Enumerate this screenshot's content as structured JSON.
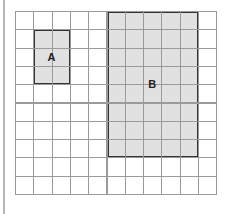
{
  "diagram": {
    "type": "grid-with-rectangles",
    "grid": {
      "columns": 11,
      "rows": 10,
      "cell_size_px": 18.3,
      "origin_px": [
        15,
        11
      ],
      "line_color": "#9a9a9a"
    },
    "shapes": [
      {
        "label": "A",
        "col": 1,
        "row": 1,
        "width_cells": 2,
        "height_cells": 3,
        "fill": "#dcdcdc",
        "stroke": "#333333"
      },
      {
        "label": "B",
        "col": 5,
        "row": 0,
        "width_cells": 5,
        "height_cells": 8,
        "fill": "#dcdcdc",
        "stroke": "#333333"
      }
    ]
  }
}
